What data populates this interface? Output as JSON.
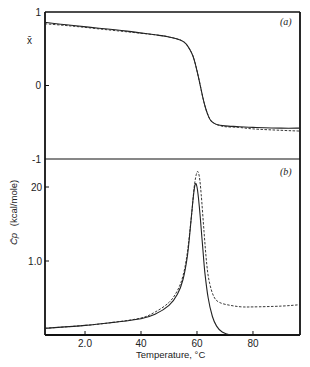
{
  "chart_data": [
    {
      "panel": "(a)",
      "type": "line",
      "title": "",
      "xlabel": "Temperature, °C",
      "ylabel": "x̄",
      "xlim": [
        5.7,
        96.8
      ],
      "ylim": [
        -1,
        1
      ],
      "yticks": [
        {
          "value": 1,
          "label": "1"
        },
        {
          "value": 0,
          "label": "0"
        },
        {
          "value": -1,
          "label": "-1"
        }
      ],
      "grid": false,
      "series": [
        {
          "name": "solid",
          "style": "solid",
          "x": [
            5.7,
            15,
            25,
            35,
            45,
            50,
            54,
            56,
            58,
            59,
            60,
            61,
            62,
            63,
            64,
            65,
            67,
            70,
            75,
            80,
            90,
            96.8
          ],
          "y": [
            0.86,
            0.82,
            0.78,
            0.74,
            0.69,
            0.66,
            0.62,
            0.57,
            0.45,
            0.35,
            0.2,
            0.03,
            -0.15,
            -0.3,
            -0.41,
            -0.48,
            -0.53,
            -0.55,
            -0.56,
            -0.57,
            -0.58,
            -0.58
          ]
        },
        {
          "name": "dashed",
          "style": "dashed",
          "x": [
            5.7,
            15,
            25,
            35,
            45,
            50,
            54,
            56,
            58,
            59,
            60,
            61,
            62,
            63,
            64,
            65,
            67,
            70,
            75,
            80,
            90,
            96.8
          ],
          "y": [
            0.84,
            0.81,
            0.77,
            0.73,
            0.69,
            0.66,
            0.62,
            0.57,
            0.45,
            0.35,
            0.2,
            0.03,
            -0.15,
            -0.3,
            -0.41,
            -0.48,
            -0.53,
            -0.56,
            -0.57,
            -0.59,
            -0.61,
            -0.62
          ]
        }
      ]
    },
    {
      "panel": "(b)",
      "type": "line",
      "title": "",
      "xlabel": "Temperature, °C",
      "ylabel": "C̄p (kcal/mole)",
      "xlim": [
        5.7,
        96.8
      ],
      "ylim": [
        0,
        2.35
      ],
      "xticks": [
        {
          "value": 20,
          "label": "2.0"
        },
        {
          "value": 40,
          "label": "40"
        },
        {
          "value": 60,
          "label": "60"
        },
        {
          "value": 80,
          "label": "80"
        }
      ],
      "yticks": [
        {
          "value": 2.0,
          "label": "20"
        },
        {
          "value": 1.0,
          "label": "1.0"
        }
      ],
      "grid": false,
      "series": [
        {
          "name": "solid",
          "style": "solid",
          "x": [
            5.7,
            20,
            30,
            40,
            45,
            50,
            53,
            55,
            56.5,
            57.5,
            58.5,
            59.3,
            60,
            60.8,
            61.8,
            62.8,
            64,
            65.5,
            67,
            69,
            72,
            75,
            80,
            90,
            96.8
          ],
          "y": [
            0.09,
            0.13,
            0.17,
            0.22,
            0.28,
            0.4,
            0.55,
            0.75,
            1.05,
            1.4,
            1.8,
            2.03,
            2.0,
            1.75,
            1.3,
            0.85,
            0.5,
            0.25,
            0.12,
            0.04,
            0.0,
            0.0,
            0.0,
            0.0,
            0.0
          ]
        },
        {
          "name": "dashed",
          "style": "dashed",
          "x": [
            5.7,
            20,
            30,
            40,
            45,
            50,
            53,
            55,
            56.5,
            58,
            59,
            60,
            60.8,
            61.5,
            62.5,
            63.5,
            64.5,
            66,
            68,
            72,
            76,
            80,
            90,
            96.8
          ],
          "y": [
            0.09,
            0.13,
            0.17,
            0.23,
            0.31,
            0.44,
            0.6,
            0.8,
            1.1,
            1.6,
            2.0,
            2.2,
            2.15,
            1.9,
            1.4,
            0.95,
            0.7,
            0.52,
            0.44,
            0.4,
            0.38,
            0.38,
            0.39,
            0.41
          ]
        }
      ]
    }
  ],
  "labels": {
    "panel_a": "(a)",
    "panel_b": "(b)",
    "y_a": "x̄",
    "y_b_symbol": "C̄p",
    "y_b_units": "(kcal/mole)",
    "x_title": "Temperature, °C"
  }
}
